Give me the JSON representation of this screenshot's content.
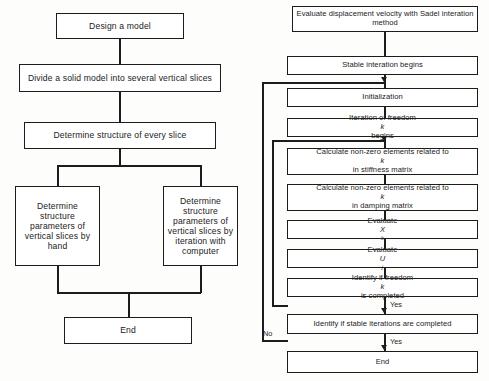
{
  "diagram": {
    "background_color": "#fdfdfc",
    "line_color": "#1c1c1c",
    "box_fill": "#ffffff"
  },
  "left_flow": {
    "name": "model-structure-flow",
    "nodes": [
      {
        "id": "design-model",
        "label": "Design a model"
      },
      {
        "id": "divide-solid-model",
        "label": "Divide a solid model into several vertical slices"
      },
      {
        "id": "determine-structure",
        "label": "Determine structure of every slice"
      },
      {
        "id": "by-hand",
        "label": "Determine structure parameters of vertical slices by hand"
      },
      {
        "id": "by-computer",
        "label": "Determine structure parameters of vertical slices by  iteration with computer"
      },
      {
        "id": "end-left",
        "label": "End"
      }
    ]
  },
  "right_flow": {
    "name": "sadel-iteration-flow",
    "nodes": [
      {
        "id": "evaluate-displacement",
        "label": "Evaluate displacement velocity with Sadel interation method"
      },
      {
        "id": "stable-iteration-begins",
        "label": "Stable interation begins"
      },
      {
        "id": "initialization",
        "label": "Initialization"
      },
      {
        "id": "iteration-freedom-begins",
        "label_pre": "Iteration of freedom ",
        "label_var": "k",
        "label_post": " begins"
      },
      {
        "id": "calc-stiffness",
        "label_pre": "Calculate non-zero elements related to ",
        "label_var": "k",
        "label_post": " in stiffness matrix"
      },
      {
        "id": "calc-damping",
        "label_pre": "Calculate non-zero elements related to ",
        "label_var": "k",
        "label_post": " in damping matrix"
      },
      {
        "id": "evaluate-x",
        "label_pre": "Evaluate ",
        "label_var": "X",
        "label_sub": "k",
        "label_post": ""
      },
      {
        "id": "evaluate-u",
        "label_pre": "Evaluate ",
        "label_var": "U",
        "label_sub": "j",
        "label_post": ""
      },
      {
        "id": "identify-freedom-completed",
        "label_pre": "Identify if freedom ",
        "label_var": "k",
        "label_post": " is completed"
      },
      {
        "id": "identify-stable-completed",
        "label": "Identify if stable iterations are completed"
      },
      {
        "id": "end-right",
        "label": "End"
      }
    ],
    "edge_labels": {
      "freedom_yes": "Yes",
      "stable_no": "No",
      "stable_yes": "Yes",
      "inner_loop_no": "No"
    }
  }
}
